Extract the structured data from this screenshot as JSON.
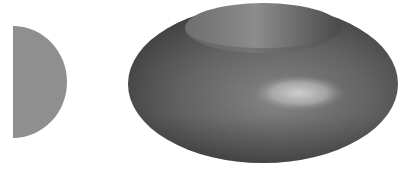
{
  "figure": {
    "shapes": [
      {
        "name": "half-disk",
        "color": "#8f8f8f"
      },
      {
        "name": "torus",
        "base_color": "#5a5a5a",
        "highlight_color": "#c4c4c4",
        "shadow_color": "#3a3a3a"
      }
    ]
  }
}
